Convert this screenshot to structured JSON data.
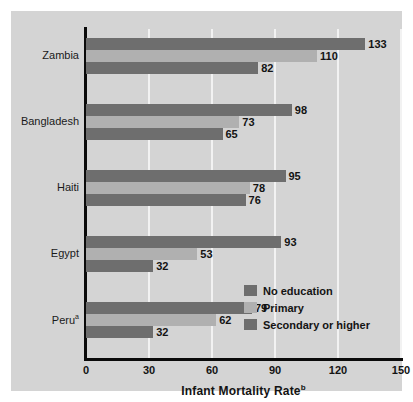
{
  "chart_data": {
    "type": "bar",
    "orientation": "horizontal",
    "title": "",
    "xlabel": "Infant Mortality Rate",
    "xlabel_superscript": "b",
    "ylabel": "",
    "xlim": [
      0,
      150
    ],
    "xticks": [
      0,
      30,
      60,
      90,
      120,
      150
    ],
    "grid": true,
    "grid_axis": "x",
    "legend_position": "inside-lower-right",
    "categories": [
      "Zambia",
      "Bangladesh",
      "Haiti",
      "Egypt",
      "Peru"
    ],
    "category_superscripts": [
      "",
      "",
      "",
      "",
      "a"
    ],
    "series": [
      {
        "name": "No education",
        "color": "#6e6e6e",
        "values": [
          133,
          98,
          95,
          93,
          79
        ]
      },
      {
        "name": "Primary",
        "color": "#b0b0b0",
        "values": [
          110,
          73,
          78,
          53,
          62
        ]
      },
      {
        "name": "Secondary or higher",
        "color": "#6e6e6e",
        "values": [
          82,
          65,
          76,
          32,
          32
        ]
      }
    ]
  },
  "colors": {
    "panel_background": "#d4d4d4",
    "page_background": "#ffffff",
    "axis": "#0a0a0a",
    "gridline": "#f2f2f2",
    "no_education": "#6e6e6e",
    "primary": "#b0b0b0",
    "secondary_or_higher": "#6e6e6e",
    "text": "#131313"
  }
}
